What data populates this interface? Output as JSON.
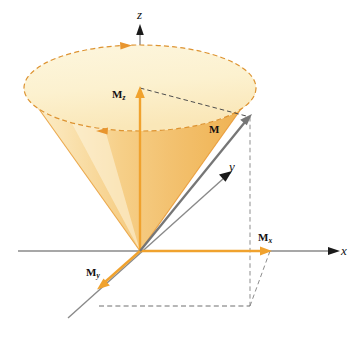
{
  "figure": {
    "background_color": "#ffffff",
    "width": 357,
    "height": 340
  },
  "colors": {
    "axis_gray": "#8a8a8a",
    "axis_arrow_black": "#1a1a1a",
    "cone_edge_orange": "#e8952e",
    "cone_fill_light": "#fdf4d8",
    "cone_fill_mid": "#f7dca0",
    "cone_fill_deep": "#f0b95c",
    "ellipse_top_fill": "#fdf3d2",
    "vector_orange": "#f0a22e",
    "vector_gray": "#767676",
    "dashed_gray": "#7d7d7d",
    "dashed_orange": "#d9952f",
    "label_black": "#111111"
  },
  "axes": [
    {
      "id": "z",
      "label": "z",
      "label_style": "italic",
      "arrow_color": "#1a1a1a",
      "line_color": "#8a8a8a"
    },
    {
      "id": "y",
      "label": "y",
      "label_style": "italic",
      "arrow_color": "#1a1a1a",
      "line_color": "#8a8a8a"
    },
    {
      "id": "x",
      "label": "x",
      "label_style": "italic",
      "arrow_color": "#1a1a1a",
      "line_color": "#8a8a8a"
    }
  ],
  "vectors": [
    {
      "id": "M",
      "label_main": "M",
      "label_sub": "",
      "color": "#767676",
      "description": "magnetization vector from origin to cone rim"
    },
    {
      "id": "Mz",
      "label_main": "M",
      "label_sub": "z",
      "color": "#f0a22e",
      "description": "z component along z axis"
    },
    {
      "id": "Mx",
      "label_main": "M",
      "label_sub": "x",
      "color": "#f0a22e",
      "description": "x component along x axis"
    },
    {
      "id": "My",
      "label_main": "M",
      "label_sub": "y",
      "color": "#f0a22e",
      "description": "y component along negative y axis"
    }
  ],
  "annotations": {
    "precession_arrows": [
      {
        "id": "precession-arrow-back",
        "direction": "right",
        "color": "#e8952e"
      },
      {
        "id": "precession-arrow-front",
        "direction": "left",
        "color": "#e8952e"
      }
    ],
    "projection_lines": "dashed gray construction lines from M to the xy plane and to the x and y axes"
  }
}
